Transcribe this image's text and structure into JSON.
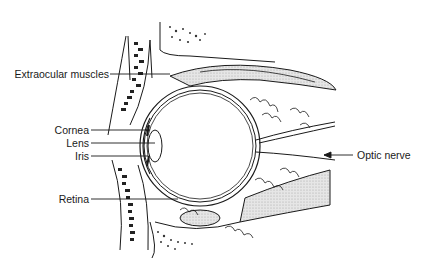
{
  "diagram": {
    "labels": {
      "extraocular_muscles": "Extraocular muscles",
      "cornea": "Cornea",
      "lens": "Lens",
      "iris": "Iris",
      "retina": "Retina",
      "optic_nerve": "Optic nerve"
    },
    "colors": {
      "line": "#1a1a1a",
      "shading": "#d9d9d9",
      "background": "#ffffff"
    }
  }
}
